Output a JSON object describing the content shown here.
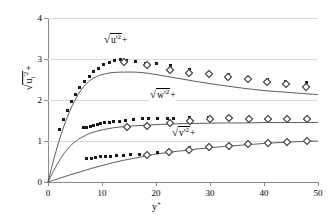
{
  "chart_data": {
    "type": "scatter",
    "title": "",
    "xlabel": "y+",
    "ylabel": "sqrt(u_i'^2)+",
    "xlim": [
      0,
      50
    ],
    "ylim": [
      0,
      4
    ],
    "xticks": [
      0,
      10,
      20,
      30,
      40,
      50
    ],
    "yticks": [
      0,
      1,
      2,
      3,
      4
    ],
    "grid": "horizontal",
    "legend": "inline-annotations",
    "annotations": [
      {
        "id": "u-label",
        "text_plain": "sqrt(u'^2)+",
        "x": 13.0,
        "y": 3.38
      },
      {
        "id": "w-label",
        "text_plain": "sqrt(w'^2)+",
        "x": 21.5,
        "y": 2.06
      },
      {
        "id": "v-label",
        "text_plain": "sqrt(v'^2)+",
        "x": 25.5,
        "y": 1.13
      }
    ],
    "series": [
      {
        "name": "sqrt(u'^2)+ DNS",
        "marker": "filled-square",
        "x": [
          2.2,
          2.9,
          3.6,
          4.3,
          5.1,
          5.9,
          6.7,
          7.6,
          8.5,
          9.4,
          10.3,
          11.3,
          12.3,
          13.4,
          14.6,
          16.2,
          18.0,
          20.1,
          22.6,
          26.2,
          29.8,
          33.4,
          37.0,
          40.6,
          44.0,
          47.8
        ],
        "y": [
          1.27,
          1.52,
          1.75,
          1.96,
          2.14,
          2.31,
          2.45,
          2.58,
          2.69,
          2.78,
          2.86,
          2.92,
          2.96,
          2.98,
          2.97,
          2.94,
          2.9,
          2.89,
          2.83,
          2.74,
          2.67,
          2.61,
          2.56,
          2.5,
          2.46,
          2.43
        ]
      },
      {
        "name": "sqrt(u'^2)+ experiment",
        "marker": "open-diamond",
        "x": [
          14.1,
          18.3,
          22.5,
          26.2,
          29.8,
          33.4,
          37.0,
          40.6,
          44.0,
          47.8
        ],
        "y": [
          2.92,
          2.86,
          2.74,
          2.67,
          2.63,
          2.56,
          2.52,
          2.45,
          2.39,
          2.32
        ]
      },
      {
        "name": "sqrt(u'^2)+ model",
        "marker": "line",
        "x": [
          0,
          1,
          2,
          3,
          4,
          5,
          6,
          7,
          8,
          9,
          10,
          12,
          14,
          16,
          18,
          20,
          24,
          28,
          32,
          36,
          40,
          44,
          48,
          50
        ],
        "y": [
          0.0,
          0.52,
          0.98,
          1.38,
          1.72,
          2.0,
          2.22,
          2.38,
          2.5,
          2.57,
          2.62,
          2.67,
          2.68,
          2.68,
          2.66,
          2.62,
          2.53,
          2.44,
          2.36,
          2.29,
          2.23,
          2.19,
          2.15,
          2.13
        ]
      },
      {
        "name": "sqrt(w'^2)+ DNS",
        "marker": "filled-square",
        "x": [
          6.6,
          7.2,
          7.8,
          8.4,
          9.1,
          9.8,
          10.5,
          11.3,
          12.2,
          13.2,
          14.4,
          15.8,
          17.5,
          18.6,
          20.2,
          22.1,
          23.2,
          26.2,
          29.8,
          33.4,
          37.2,
          40.8,
          44.2,
          47.8
        ],
        "y": [
          1.33,
          1.34,
          1.36,
          1.38,
          1.4,
          1.42,
          1.44,
          1.45,
          1.47,
          1.48,
          1.5,
          1.52,
          1.54,
          1.54,
          1.55,
          1.56,
          1.55,
          1.57,
          1.57,
          1.57,
          1.56,
          1.56,
          1.55,
          1.56
        ]
      },
      {
        "name": "sqrt(w'^2)+ experiment",
        "marker": "open-diamond",
        "x": [
          14.6,
          18.4,
          22.6,
          26.3,
          30.0,
          33.6,
          37.2,
          40.8,
          44.3,
          48.0
        ],
        "y": [
          1.34,
          1.37,
          1.45,
          1.5,
          1.54,
          1.55,
          1.54,
          1.54,
          1.53,
          1.53
        ]
      },
      {
        "name": "sqrt(w'^2)+ model",
        "marker": "line",
        "x": [
          0,
          1,
          2,
          3,
          4,
          5,
          6,
          8,
          10,
          12,
          14,
          16,
          20,
          24,
          28,
          32,
          36,
          40,
          44,
          48,
          50
        ],
        "y": [
          0.0,
          0.26,
          0.5,
          0.7,
          0.86,
          0.98,
          1.07,
          1.2,
          1.27,
          1.32,
          1.35,
          1.37,
          1.4,
          1.42,
          1.43,
          1.44,
          1.44,
          1.45,
          1.45,
          1.45,
          1.45
        ]
      },
      {
        "name": "sqrt(v'^2)+ DNS",
        "marker": "filled-square",
        "x": [
          7.2,
          8.0,
          8.8,
          9.7,
          10.6,
          11.6,
          12.7,
          13.9,
          15.3,
          16.9,
          18.5,
          20.2,
          22.3,
          26.2,
          29.8,
          33.4,
          37.0,
          40.6,
          44.2,
          47.8
        ],
        "y": [
          0.57,
          0.58,
          0.6,
          0.61,
          0.62,
          0.63,
          0.64,
          0.65,
          0.66,
          0.68,
          0.7,
          0.73,
          0.78,
          0.84,
          0.88,
          0.91,
          0.94,
          0.96,
          0.98,
          1.0
        ]
      },
      {
        "name": "sqrt(v'^2)+ experiment",
        "marker": "open-diamond",
        "x": [
          18.4,
          22.4,
          26.2,
          29.9,
          33.5,
          37.1,
          40.7,
          44.2,
          47.9
        ],
        "y": [
          0.66,
          0.73,
          0.79,
          0.85,
          0.89,
          0.93,
          0.96,
          0.98,
          1.0
        ]
      },
      {
        "name": "sqrt(v'^2)+ model",
        "marker": "line",
        "x": [
          0,
          2,
          4,
          6,
          8,
          10,
          12,
          14,
          16,
          18,
          20,
          24,
          28,
          32,
          36,
          40,
          44,
          48,
          50
        ],
        "y": [
          0.0,
          0.085,
          0.17,
          0.25,
          0.33,
          0.4,
          0.47,
          0.53,
          0.58,
          0.63,
          0.68,
          0.75,
          0.81,
          0.86,
          0.9,
          0.94,
          0.97,
          0.99,
          1.0
        ]
      }
    ]
  },
  "axes": {
    "y_title_parts": {
      "radicand_base": "u",
      "radicand_sub": "i",
      "radicand_prime_sup": "'2",
      "plus": "+"
    },
    "x_title_parts": {
      "base": "y",
      "sup": "+"
    }
  },
  "labels": {
    "u_series": {
      "radicand": "u'",
      "exponent": "2",
      "plus": "+"
    },
    "w_series": {
      "radicand": "w'",
      "exponent": "2",
      "plus": "+"
    },
    "v_series": {
      "radicand": "v'",
      "exponent": "2",
      "plus": "+"
    }
  },
  "ticks": {
    "y": [
      "4",
      "3",
      "2",
      "1",
      "0"
    ],
    "x": [
      "0",
      "10",
      "20",
      "30",
      "40",
      "50"
    ]
  },
  "colors": {
    "marker_filled": "#1a1a1a",
    "marker_open_stroke": "#2b2b2b",
    "curve": "#4a4a4a",
    "axis": "#8a8a8a",
    "grid": "#d9d9d9",
    "background": "#ffffff"
  }
}
